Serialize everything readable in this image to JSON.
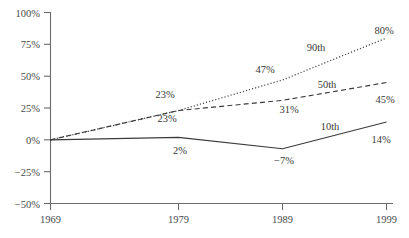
{
  "chart_data": {
    "type": "line",
    "title": "",
    "xlabel": "",
    "ylabel": "",
    "x": [
      1969,
      1979,
      1989,
      1999
    ],
    "xtick_labels": [
      "1969",
      "1979",
      "1989",
      "1999"
    ],
    "ytick_labels": [
      "100%",
      "75%",
      "50%",
      "25%",
      "0%",
      "−25%",
      "−50%"
    ],
    "ytick_values": [
      100,
      75,
      50,
      25,
      0,
      -25,
      -50
    ],
    "ylim": [
      -50,
      100
    ],
    "grid": false,
    "legend": "inline-series-labels",
    "series": [
      {
        "name": "90th",
        "label": "90th",
        "style": "dotted",
        "values": [
          0,
          23,
          47,
          80
        ],
        "point_labels": [
          "",
          "23%",
          "47%",
          "80%"
        ]
      },
      {
        "name": "50th",
        "label": "50th",
        "style": "dashed",
        "values": [
          0,
          23,
          31,
          45
        ],
        "point_labels": [
          "",
          "23%",
          "31%",
          "45%"
        ]
      },
      {
        "name": "10th",
        "label": "10th",
        "style": "solid",
        "values": [
          0,
          2,
          -7,
          14
        ],
        "point_labels": [
          "",
          "2%",
          "−7%",
          "14%"
        ]
      }
    ],
    "annotations": {
      "series_label_90th": "90th",
      "series_label_50th": "50th",
      "series_label_10th": "10th",
      "v90_1979": "23%",
      "v90_1989": "47%",
      "v90_1999": "80%",
      "v50_1979": "23%",
      "v50_1989": "31%",
      "v50_1999": "45%",
      "v10_1979": "2%",
      "v10_1989": "−7%",
      "v10_1999": "14%"
    },
    "colors": {
      "line": "#3b3b3b",
      "axis": "#6b6b6b",
      "text": "#3a3a3a",
      "background": "#ffffff"
    }
  }
}
